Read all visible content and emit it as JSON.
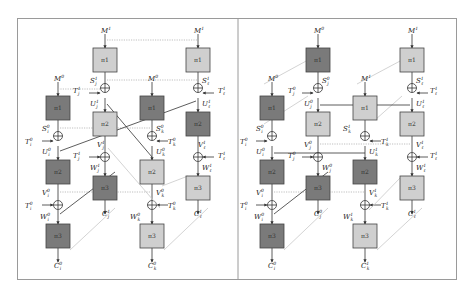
{
  "colors": {
    "dark_box": "#7a7a7a",
    "light_box": "#cfcfcf",
    "box_stroke": "#444444",
    "frame": "#9a9a9a",
    "dotted": "#b8b8b8",
    "light_diag": "#c8c8c8",
    "solid": "#333333"
  },
  "left_panel": {
    "boxes": [
      {
        "id": "L_B_pi1",
        "x": 93,
        "y": 48,
        "shade": "light",
        "label": "π1"
      },
      {
        "id": "L_D_pi1",
        "x": 186,
        "y": 48,
        "shade": "light",
        "label": "π1"
      },
      {
        "id": "L_A_pi1",
        "x": 46,
        "y": 96,
        "shade": "dark",
        "label": "π1"
      },
      {
        "id": "L_C_pi1",
        "x": 140,
        "y": 96,
        "shade": "dark",
        "label": "π1"
      },
      {
        "id": "L_B_pi2",
        "x": 93,
        "y": 112,
        "shade": "light",
        "label": "π2"
      },
      {
        "id": "L_D_pi2",
        "x": 186,
        "y": 112,
        "shade": "dark",
        "label": "π2"
      },
      {
        "id": "L_A_pi2",
        "x": 46,
        "y": 160,
        "shade": "dark",
        "label": "π2"
      },
      {
        "id": "L_C_pi2",
        "x": 140,
        "y": 160,
        "shade": "light",
        "label": "π2"
      },
      {
        "id": "L_B_pi3",
        "x": 93,
        "y": 176,
        "shade": "dark",
        "label": "π3"
      },
      {
        "id": "L_D_pi3",
        "x": 186,
        "y": 176,
        "shade": "light",
        "label": "π3"
      },
      {
        "id": "L_A_pi3",
        "x": 46,
        "y": 224,
        "shade": "dark",
        "label": "π3"
      },
      {
        "id": "L_C_pi3",
        "x": 140,
        "y": 224,
        "shade": "light",
        "label": "π3"
      }
    ],
    "labels": [
      {
        "t": "M",
        "sup": "1",
        "sub": "",
        "x": 101,
        "y": 33
      },
      {
        "t": "M",
        "sup": "1",
        "sub": "",
        "x": 194,
        "y": 33
      },
      {
        "t": "M",
        "sup": "0",
        "sub": "",
        "x": 54,
        "y": 81
      },
      {
        "t": "M",
        "sup": "0",
        "sub": "",
        "x": 148,
        "y": 81
      },
      {
        "t": "S",
        "sup": "1",
        "sub": "j",
        "x": 90,
        "y": 83
      },
      {
        "t": "S",
        "sup": "1",
        "sub": "ℓ",
        "x": 202,
        "y": 83
      },
      {
        "t": "T",
        "sup": "1",
        "sub": "j",
        "x": 73,
        "y": 93
      },
      {
        "t": "T",
        "sup": "1",
        "sub": "ℓ",
        "x": 218,
        "y": 93
      },
      {
        "t": "U",
        "sup": "1",
        "sub": "j",
        "x": 90,
        "y": 106
      },
      {
        "t": "U",
        "sup": "1",
        "sub": "ℓ",
        "x": 202,
        "y": 106
      },
      {
        "t": "S",
        "sup": "0",
        "sub": "i",
        "x": 42,
        "y": 131
      },
      {
        "t": "S",
        "sup": "0",
        "sub": "k",
        "x": 156,
        "y": 131
      },
      {
        "t": "T",
        "sup": "0",
        "sub": "i",
        "x": 25,
        "y": 144
      },
      {
        "t": "T",
        "sup": "0",
        "sub": "k",
        "x": 168,
        "y": 144
      },
      {
        "t": "V",
        "sup": "1",
        "sub": "j",
        "x": 97,
        "y": 147
      },
      {
        "t": "V",
        "sup": "1",
        "sub": "ℓ",
        "x": 198,
        "y": 147
      },
      {
        "t": "U",
        "sup": "0",
        "sub": "i",
        "x": 42,
        "y": 154
      },
      {
        "t": "U",
        "sup": "0",
        "sub": "k",
        "x": 156,
        "y": 154
      },
      {
        "t": "T",
        "sup": "1",
        "sub": "j",
        "x": 73,
        "y": 158
      },
      {
        "t": "T",
        "sup": "1",
        "sub": "ℓ",
        "x": 218,
        "y": 158
      },
      {
        "t": "W",
        "sup": "1",
        "sub": "j",
        "x": 90,
        "y": 170
      },
      {
        "t": "W",
        "sup": "1",
        "sub": "ℓ",
        "x": 202,
        "y": 170
      },
      {
        "t": "V",
        "sup": "0",
        "sub": "i",
        "x": 42,
        "y": 195
      },
      {
        "t": "V",
        "sup": "0",
        "sub": "k",
        "x": 156,
        "y": 195
      },
      {
        "t": "T",
        "sup": "0",
        "sub": "i",
        "x": 25,
        "y": 208
      },
      {
        "t": "T",
        "sup": "0",
        "sub": "k",
        "x": 168,
        "y": 208
      },
      {
        "t": "C",
        "sup": "1",
        "sub": "j",
        "x": 102,
        "y": 216
      },
      {
        "t": "C",
        "sup": "1",
        "sub": "ℓ",
        "x": 194,
        "y": 216
      },
      {
        "t": "W",
        "sup": "0",
        "sub": "i",
        "x": 40,
        "y": 219
      },
      {
        "t": "W",
        "sup": "0",
        "sub": "k",
        "x": 130,
        "y": 219
      },
      {
        "t": "C",
        "sup": "0",
        "sub": "i",
        "x": 54,
        "y": 268
      },
      {
        "t": "C",
        "sup": "0",
        "sub": "k",
        "x": 148,
        "y": 268
      }
    ]
  },
  "right_panel": {
    "boxes": [
      {
        "id": "R_B_pi1",
        "x": 306,
        "y": 48,
        "shade": "dark",
        "label": "π1"
      },
      {
        "id": "R_D_pi1",
        "x": 400,
        "y": 48,
        "shade": "light",
        "label": "π1"
      },
      {
        "id": "R_A_pi1",
        "x": 260,
        "y": 96,
        "shade": "dark",
        "label": "π1"
      },
      {
        "id": "R_C_pi1",
        "x": 353,
        "y": 96,
        "shade": "light",
        "label": "π1"
      },
      {
        "id": "R_B_pi2",
        "x": 306,
        "y": 112,
        "shade": "light",
        "label": "π2"
      },
      {
        "id": "R_D_pi2",
        "x": 400,
        "y": 112,
        "shade": "light",
        "label": "π2"
      },
      {
        "id": "R_A_pi2",
        "x": 260,
        "y": 160,
        "shade": "dark",
        "label": "π2"
      },
      {
        "id": "R_C_pi2",
        "x": 353,
        "y": 160,
        "shade": "dark",
        "label": "π2"
      },
      {
        "id": "R_B_pi3",
        "x": 306,
        "y": 176,
        "shade": "dark",
        "label": "π3"
      },
      {
        "id": "R_D_pi3",
        "x": 400,
        "y": 176,
        "shade": "light",
        "label": "π3"
      },
      {
        "id": "R_A_pi3",
        "x": 260,
        "y": 224,
        "shade": "dark",
        "label": "π3"
      },
      {
        "id": "R_C_pi3",
        "x": 353,
        "y": 224,
        "shade": "light",
        "label": "π3"
      }
    ],
    "labels": [
      {
        "t": "M",
        "sup": "0",
        "sub": "",
        "x": 314,
        "y": 33
      },
      {
        "t": "M",
        "sup": "1",
        "sub": "",
        "x": 408,
        "y": 33
      },
      {
        "t": "M",
        "sup": "0",
        "sub": "",
        "x": 268,
        "y": 81
      },
      {
        "t": "M",
        "sup": "1",
        "sub": "",
        "x": 361,
        "y": 81
      },
      {
        "t": "S",
        "sup": "0",
        "sub": "j",
        "x": 322,
        "y": 83
      },
      {
        "t": "S",
        "sup": "1",
        "sub": "ℓ",
        "x": 416,
        "y": 83
      },
      {
        "t": "T",
        "sup": "0",
        "sub": "j",
        "x": 288,
        "y": 93
      },
      {
        "t": "T",
        "sup": "1",
        "sub": "ℓ",
        "x": 430,
        "y": 93
      },
      {
        "t": "U",
        "sup": "0",
        "sub": "j",
        "x": 304,
        "y": 106
      },
      {
        "t": "U",
        "sup": "1",
        "sub": "ℓ",
        "x": 416,
        "y": 106
      },
      {
        "t": "S",
        "sup": "0",
        "sub": "i",
        "x": 256,
        "y": 131
      },
      {
        "t": "S",
        "sup": "1",
        "sub": "k",
        "x": 343,
        "y": 131
      },
      {
        "t": "T",
        "sup": "0",
        "sub": "i",
        "x": 240,
        "y": 144
      },
      {
        "t": "T",
        "sup": "1",
        "sub": "k",
        "x": 381,
        "y": 144
      },
      {
        "t": "V",
        "sup": "0",
        "sub": "j",
        "x": 304,
        "y": 147
      },
      {
        "t": "V",
        "sup": "1",
        "sub": "ℓ",
        "x": 416,
        "y": 147
      },
      {
        "t": "U",
        "sup": "0",
        "sub": "i",
        "x": 256,
        "y": 154
      },
      {
        "t": "U",
        "sup": "1",
        "sub": "k",
        "x": 369,
        "y": 154
      },
      {
        "t": "T",
        "sup": "0",
        "sub": "j",
        "x": 288,
        "y": 158
      },
      {
        "t": "T",
        "sup": "1",
        "sub": "ℓ",
        "x": 430,
        "y": 158
      },
      {
        "t": "W",
        "sup": "0",
        "sub": "j",
        "x": 322,
        "y": 170
      },
      {
        "t": "W",
        "sup": "1",
        "sub": "ℓ",
        "x": 416,
        "y": 170
      },
      {
        "t": "V",
        "sup": "0",
        "sub": "i",
        "x": 256,
        "y": 195
      },
      {
        "t": "V",
        "sup": "1",
        "sub": "k",
        "x": 369,
        "y": 195
      },
      {
        "t": "T",
        "sup": "0",
        "sub": "i",
        "x": 240,
        "y": 208
      },
      {
        "t": "T",
        "sup": "1",
        "sub": "k",
        "x": 381,
        "y": 208
      },
      {
        "t": "C",
        "sup": "0",
        "sub": "j",
        "x": 314,
        "y": 216
      },
      {
        "t": "C",
        "sup": "1",
        "sub": "ℓ",
        "x": 408,
        "y": 216
      },
      {
        "t": "W",
        "sup": "0",
        "sub": "i",
        "x": 254,
        "y": 219
      },
      {
        "t": "W",
        "sup": "1",
        "sub": "k",
        "x": 343,
        "y": 219
      },
      {
        "t": "C",
        "sup": "0",
        "sub": "i",
        "x": 268,
        "y": 268
      },
      {
        "t": "C",
        "sup": "1",
        "sub": "k",
        "x": 361,
        "y": 268
      }
    ]
  }
}
